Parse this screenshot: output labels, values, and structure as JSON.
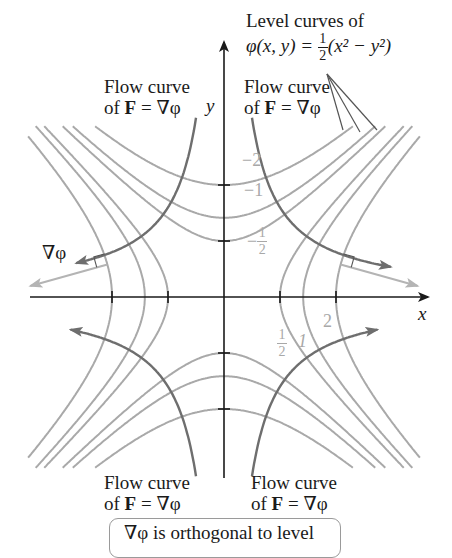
{
  "title": {
    "line1": "Level curves of",
    "line2_lhs": "φ(x, y) = ",
    "frac_num": "1",
    "frac_den": "2",
    "line2_rhs": "(x² − y²)"
  },
  "flow_labels": {
    "top_left": {
      "line1": "Flow curve",
      "of": "of ",
      "F": "F",
      "eq": " = ∇φ"
    },
    "top_right": {
      "line1": "Flow curve",
      "of": "of ",
      "F": "F",
      "eq": " = ∇φ"
    },
    "bottom_left": {
      "line1": "Flow curve",
      "of": "of ",
      "F": "F",
      "eq": " = ∇φ"
    },
    "bottom_right": {
      "line1": "Flow curve",
      "of": "of ",
      "F": "F",
      "eq": " = ∇φ"
    }
  },
  "axes": {
    "x_label": "x",
    "y_label": "y"
  },
  "gradient_label": "∇φ",
  "level_labels": {
    "neg2": "−2",
    "neg1": "−1",
    "neg_half_sign": "−",
    "neg_half_num": "1",
    "neg_half_den": "2",
    "pos_half_num": "1",
    "pos_half_den": "2",
    "pos1": "1",
    "pos2": "2"
  },
  "note": "∇φ is orthogonal to level",
  "colors": {
    "level_curve": "#a9a9a9",
    "flow_curve": "#6e6e6e",
    "gradient_arrow": "#b4b4b4",
    "axis": "#1a1a1a"
  },
  "geometry": {
    "origin": [
      224,
      297
    ],
    "unit_px": 56,
    "level_values_c": [
      -2,
      -1,
      -0.5,
      0.5,
      1,
      2
    ]
  }
}
